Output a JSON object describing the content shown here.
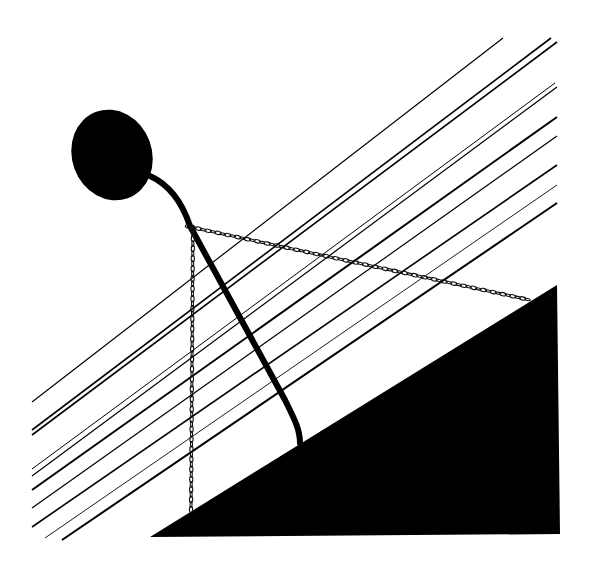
{
  "artwork": {
    "background": "#ffffff",
    "ink": "#000000",
    "lines": [
      {
        "x1": 32,
        "y1": 402,
        "x2": 503,
        "y2": 38,
        "w": 1.2
      },
      {
        "x1": 32,
        "y1": 430,
        "x2": 551,
        "y2": 38,
        "w": 1.6
      },
      {
        "x1": 32,
        "y1": 435,
        "x2": 557,
        "y2": 42,
        "w": 1.6
      },
      {
        "x1": 32,
        "y1": 469,
        "x2": 555,
        "y2": 83,
        "w": 1.0
      },
      {
        "x1": 32,
        "y1": 476,
        "x2": 557,
        "y2": 87,
        "w": 1.2
      },
      {
        "x1": 32,
        "y1": 490,
        "x2": 557,
        "y2": 117,
        "w": 2.0
      },
      {
        "x1": 32,
        "y1": 508,
        "x2": 557,
        "y2": 136,
        "w": 1.2
      },
      {
        "x1": 32,
        "y1": 527,
        "x2": 557,
        "y2": 165,
        "w": 1.6
      },
      {
        "x1": 45,
        "y1": 538,
        "x2": 557,
        "y2": 185,
        "w": 0.9
      },
      {
        "x1": 62,
        "y1": 540,
        "x2": 557,
        "y2": 203,
        "w": 2.0
      }
    ],
    "head": {
      "cx": 112,
      "cy": 155,
      "rx": 40,
      "ry": 46,
      "rotate": -20
    },
    "stem": "M150,176 C170,185 183,205 190,226 L285,400 C295,420 300,430 300,443",
    "chain_diagonal": {
      "x1": 186,
      "y1": 226,
      "x2": 530,
      "y2": 300
    },
    "chain_vertical": {
      "x1": 193,
      "y1": 226,
      "x2": 191,
      "y2": 512
    },
    "ground_triangle": "150,537 557,285 560,534"
  }
}
